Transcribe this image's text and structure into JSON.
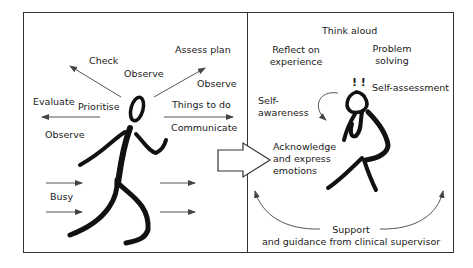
{
  "left_panel": {
    "labels": {
      "check": "Check",
      "assess_plan": "Assess plan",
      "observe_top": "Observe",
      "observe_right": "Observe",
      "evaluate": "Evaluate",
      "prioritise": "Prioritise",
      "things_to_do": "Things to do",
      "communicate": "Communicate",
      "observe_left": "Observe",
      "busy": "Busy"
    },
    "figure": "running-figure"
  },
  "transition_arrow": "block-arrow-right",
  "right_panel": {
    "labels": {
      "think_aloud": "Think aloud",
      "reflect_line1": "Reflect on",
      "reflect_line2": "experience",
      "problem_line1": "Problem",
      "problem_line2": "solving",
      "exclaim": "! !",
      "self_assessment": "Self-assessment",
      "self_awareness_line1": "Self-",
      "self_awareness_line2": "awareness",
      "acknowledge_line1": "Acknowledge",
      "acknowledge_line2": "and express",
      "acknowledge_line3": "emotions",
      "support_line1": "Support",
      "support_line2": "and guidance from clinical supervisor"
    },
    "figure": "thinking-figure"
  },
  "colors": {
    "stroke": "#111111",
    "arrow": "#444444",
    "frame": "#333333"
  }
}
